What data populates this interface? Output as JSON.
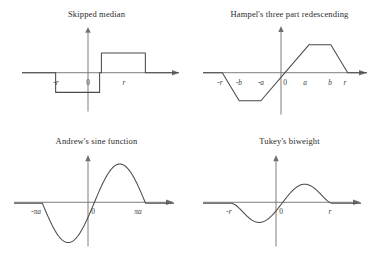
{
  "figure": {
    "background": "#ffffff",
    "line_color": "#4a4a4a",
    "axis_color": "#6f6f6f",
    "layout": "2x2 grid of psi-function plots"
  },
  "panels": [
    {
      "id": "skipped-median",
      "title": "Skipped median",
      "x_tick_labels": [
        "-r",
        "0",
        "r"
      ],
      "description": "step function: negative constant on (-r,0), positive constant on (0,r), zero outside"
    },
    {
      "id": "hampel-three-part-redescending",
      "title": "Hampel's three part redescending",
      "x_tick_labels": [
        "-r",
        "-b",
        "-a",
        "0",
        "a",
        "b",
        "r"
      ],
      "description": "linear rise to a, plateau a to b, linear descent b to r, zero beyond r; odd symmetric"
    },
    {
      "id": "andrews-sine-function",
      "title": "Andrew's sine function",
      "x_tick_labels": [
        "-πa",
        "0",
        "πa"
      ],
      "description": "one full sine period sin(x/a) on -pi*a to pi*a, zero outside"
    },
    {
      "id": "tukeys-biweight",
      "title": "Tukey's biweight",
      "x_tick_labels": [
        "-r",
        "0",
        "r"
      ],
      "description": "x(1-(x/r)^2)^2 on -r to r, zero outside"
    }
  ],
  "chart_data": [
    {
      "type": "line",
      "title": "Skipped median",
      "xlabel": "",
      "ylabel": "",
      "xlim": [
        -1.75,
        1.75
      ],
      "ylim": [
        -1.35,
        1.35
      ],
      "grid": false,
      "legend": null,
      "xticks": [
        -1,
        0,
        1
      ],
      "xticklabels": [
        "-r",
        "0",
        "r"
      ],
      "series": [
        {
          "name": "psi(x) skipped median",
          "x": [
            -1.75,
            -1.0,
            -1.0,
            -0.02,
            -0.02,
            0.02,
            0.02,
            1.0,
            1.0,
            1.75
          ],
          "y": [
            0,
            0,
            -0.62,
            -0.62,
            0,
            0,
            0.62,
            0.62,
            0,
            0
          ]
        }
      ],
      "annotations": [
        "jump discontinuity at x = 0",
        "zero outside (-r, r)"
      ]
    },
    {
      "type": "line",
      "title": "Hampel's three part redescending",
      "xlabel": "",
      "ylabel": "",
      "xlim": [
        -1.7,
        1.7
      ],
      "ylim": [
        -1.15,
        1.15
      ],
      "grid": false,
      "legend": null,
      "xticks": [
        -1.3,
        -0.95,
        -0.5,
        0,
        0.5,
        0.95,
        1.3
      ],
      "xticklabels": [
        "-r",
        "-b",
        "-a",
        "0",
        "a",
        "b",
        "r"
      ],
      "series": [
        {
          "name": "psi(x) Hampel",
          "x": [
            -1.7,
            -1.3,
            -0.95,
            -0.5,
            0,
            0.5,
            0.95,
            1.3,
            1.7
          ],
          "y": [
            0,
            0,
            -0.72,
            -0.72,
            0,
            0.72,
            0.72,
            0,
            0
          ]
        }
      ],
      "annotations": [
        "plateau between a and b",
        "redescends to zero at r"
      ]
    },
    {
      "type": "line",
      "title": "Andrew's sine function",
      "xlabel": "",
      "ylabel": "",
      "xlim": [
        -1.55,
        1.55
      ],
      "ylim": [
        -1.15,
        1.15
      ],
      "grid": false,
      "legend": null,
      "xticks": [
        -1,
        0,
        1
      ],
      "xticklabels": [
        "-πa",
        "0",
        "πa"
      ],
      "function": "sin(pi*x) for |x| <= 1, else 0",
      "samples": 160,
      "annotations": [
        "one complete sine period across (-pi a, pi a)"
      ]
    },
    {
      "type": "line",
      "title": "Tukey's biweight",
      "xlabel": "",
      "ylabel": "",
      "xlim": [
        -1.55,
        1.55
      ],
      "ylim": [
        -1.15,
        1.15
      ],
      "grid": false,
      "legend": null,
      "xticks": [
        -1,
        0,
        1
      ],
      "xticklabels": [
        "-r",
        "0",
        "r"
      ],
      "function": "x*(1-(x/r)^2)^2 for |x| <= r, else 0",
      "samples": 160,
      "annotations": [
        "smooth redescending to zero at +/- r"
      ]
    }
  ]
}
